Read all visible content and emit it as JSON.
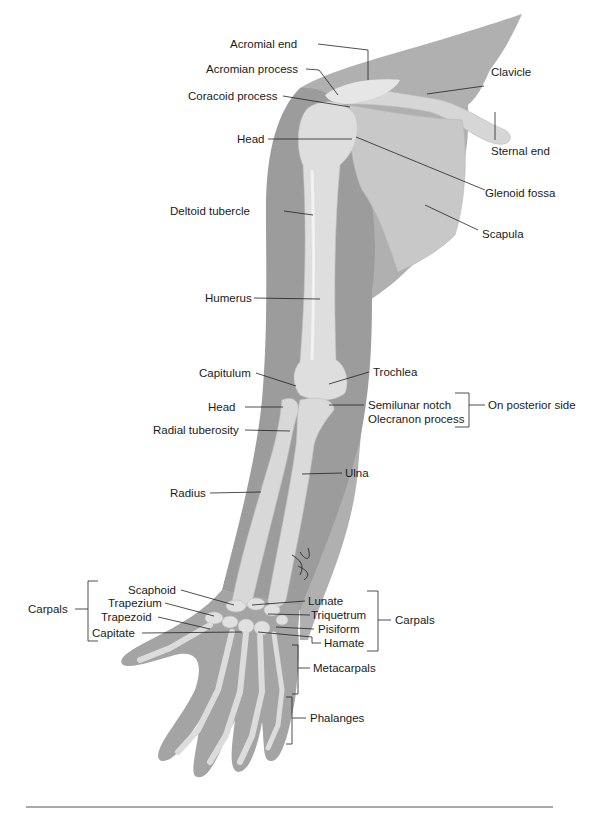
{
  "figure": {
    "colors": {
      "background": "#ffffff",
      "skin_silhouette": "#9a9a9a",
      "skin_light": "#b4b4b4",
      "bone": "#dcdcdc",
      "bone_highlight": "#efefef",
      "leader_line": "#222222",
      "label_text": "#1a1a1a"
    },
    "labels": {
      "acromial_end": "Acromial end",
      "acromian_process": "Acromian process",
      "coracoid_process": "Coracoid process",
      "clavicle": "Clavicle",
      "sternal_end": "Sternal end",
      "head_humerus": "Head",
      "glenoid_fossa": "Glenoid fossa",
      "deltoid_tubercle": "Deltoid tubercle",
      "scapula": "Scapula",
      "humerus": "Humerus",
      "capitulum": "Capitulum",
      "trochlea": "Trochlea",
      "head_radius": "Head",
      "semilunar_notch": "Semilunar notch",
      "olecranon_process": "Olecranon process",
      "on_posterior_side": "On posterior side",
      "radial_tuberosity": "Radial tuberosity",
      "ulna": "Ulna",
      "radius": "Radius",
      "scaphoid": "Scaphoid",
      "trapezium": "Trapezium",
      "trapezoid": "Trapezoid",
      "capitate": "Capitate",
      "carpals_left": "Carpals",
      "lunate": "Lunate",
      "triquetrum": "Triquetrum",
      "pisiform": "Pisiform",
      "hamate": "Hamate",
      "carpals_right": "Carpals",
      "metacarpals": "Metacarpals",
      "phalanges": "Phalanges"
    }
  }
}
